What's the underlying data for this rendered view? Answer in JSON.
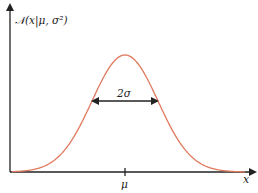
{
  "figure": {
    "y_axis_label": "𝒩(x|μ, σ²)",
    "x_axis_label": "x",
    "mean_label": "μ",
    "width_label": "2σ",
    "curve_color": "#e07a5f",
    "axis_color": "#222222"
  },
  "chart_data": {
    "type": "line",
    "title": "",
    "xlabel": "x",
    "ylabel": "N(x|μ, σ²)",
    "series": [
      {
        "name": "N(x|μ, σ²)",
        "function": "gaussian",
        "mean": "μ",
        "std": "σ"
      }
    ],
    "annotations": [
      "μ",
      "2σ"
    ],
    "grid": false
  }
}
